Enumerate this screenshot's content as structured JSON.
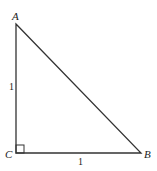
{
  "diagram": {
    "type": "right-triangle",
    "vertices": {
      "A": {
        "label": "A",
        "x": 16,
        "y": 24
      },
      "B": {
        "label": "B",
        "x": 141,
        "y": 153
      },
      "C": {
        "label": "C",
        "x": 16,
        "y": 153
      }
    },
    "right_angle_at": "C",
    "sides": {
      "AC": {
        "label": "1"
      },
      "CB": {
        "label": "1"
      }
    },
    "stroke_color": "#333333"
  }
}
